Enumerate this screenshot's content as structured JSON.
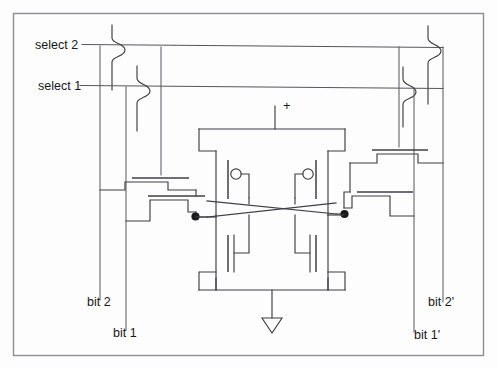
{
  "figure": {
    "kind": "circuit-schematic",
    "frame_color": "#8d8d93",
    "wire_color": "#3f3f44",
    "background_color": "#fdfdfd"
  },
  "labels": {
    "select_2": "select 2",
    "select_1": "select 1",
    "bit_2": "bit 2",
    "bit_1": "bit 1",
    "bit_2_prime": "bit 2'",
    "bit_1_prime": "bit 1'",
    "supply_plus": "+"
  },
  "nets": {
    "word_lines": [
      "select 2",
      "select 1"
    ],
    "bit_lines": [
      "bit 2",
      "bit 1",
      "bit 2'",
      "bit 1'"
    ],
    "power": "+",
    "ground": "ground-triangle"
  },
  "devices": {
    "pmos_count": 2,
    "nmos_count": 6,
    "pass_transistors": 4,
    "inverters": 2
  },
  "storage_nodes": {
    "left": "Q",
    "right": "Q-bar"
  }
}
